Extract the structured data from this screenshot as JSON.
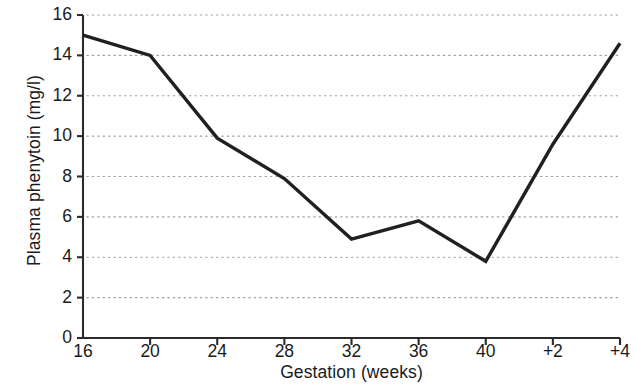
{
  "chart_data": {
    "type": "line",
    "title": "",
    "subtitle": "",
    "xlabel": "Gestation (weeks)",
    "ylabel": "Plasma phenytoin (mg/l)",
    "x": [
      "16",
      "20",
      "24",
      "28",
      "32",
      "36",
      "40",
      "+2",
      "+4"
    ],
    "categories": [
      "16",
      "20",
      "24",
      "28",
      "32",
      "36",
      "40",
      "+2",
      "+4"
    ],
    "xtick_labels": [
      "16",
      "20",
      "24",
      "28",
      "32",
      "36",
      "40",
      "+2",
      "+4"
    ],
    "ytick_labels": [
      "0",
      "2",
      "4",
      "6",
      "8",
      "10",
      "12",
      "14",
      "16"
    ],
    "ytick_values": [
      0,
      2,
      4,
      6,
      8,
      10,
      12,
      14,
      16
    ],
    "values": [
      15.0,
      14.0,
      9.9,
      7.9,
      4.9,
      5.8,
      3.8,
      9.6,
      14.6
    ],
    "series": [
      {
        "name": "Plasma phenytoin",
        "values": [
          15.0,
          14.0,
          9.9,
          7.9,
          4.9,
          5.8,
          3.8,
          9.6,
          14.6
        ]
      }
    ],
    "ylim": [
      0,
      16
    ],
    "xlim": [
      0,
      8
    ],
    "grid": true,
    "grid_axis": "y",
    "grid_style": "dotted",
    "legend": false,
    "legend_position": "none",
    "markers": false,
    "line_color": "#231f20",
    "grid_color": "#9a9a9a",
    "axis_color": "#2b2b2b",
    "background": "#ffffff"
  }
}
